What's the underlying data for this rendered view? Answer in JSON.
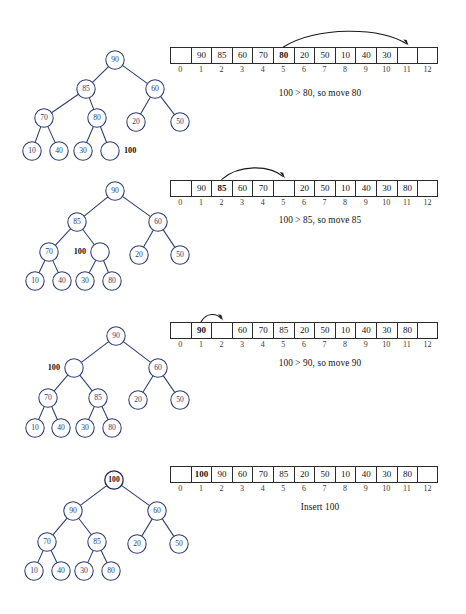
{
  "figure": {
    "node_stroke": "#2e3a72",
    "cell_stroke": "#2b2b2b",
    "arrow_color": "#1a1a1a"
  },
  "array_indices": [
    "0",
    "1",
    "2",
    "3",
    "4",
    "5",
    "6",
    "7",
    "8",
    "9",
    "10",
    "11",
    "12"
  ],
  "steps": [
    {
      "id": "step-1",
      "caption": "100 > 80, so move 80",
      "array": [
        "",
        "90",
        "85",
        "60",
        "70",
        "80",
        "20",
        "50",
        "10",
        "40",
        "30",
        "",
        ""
      ],
      "highlight_index": 5,
      "arrow": {
        "from_index": 5,
        "to_index": 11
      },
      "tree": {
        "nodes": [
          {
            "id": "n90",
            "label": "90",
            "x": 115,
            "y": 60,
            "empty": false,
            "bold": false
          },
          {
            "id": "n85",
            "label": "85",
            "x": 86,
            "y": 89,
            "empty": false,
            "bold": false
          },
          {
            "id": "n60",
            "label": "60",
            "x": 155,
            "y": 89,
            "empty": false,
            "bold": false
          },
          {
            "id": "n70",
            "label": "70",
            "x": 44,
            "y": 118,
            "empty": false,
            "bold": false
          },
          {
            "id": "n80",
            "label": "80",
            "x": 97,
            "y": 118,
            "empty": false,
            "bold": false
          },
          {
            "id": "n20",
            "label": "20",
            "x": 136,
            "y": 122,
            "empty": false,
            "bold": false
          },
          {
            "id": "n50",
            "label": "50",
            "x": 180,
            "y": 122,
            "empty": false,
            "bold": false
          },
          {
            "id": "n10",
            "label": "10",
            "x": 32,
            "y": 151,
            "empty": false,
            "bold": false
          },
          {
            "id": "n40",
            "label": "40",
            "x": 59,
            "y": 151,
            "empty": false,
            "bold": false
          },
          {
            "id": "n30",
            "label": "30",
            "x": 83,
            "y": 151,
            "empty": false,
            "bold": false
          },
          {
            "id": "nhole",
            "label": "",
            "x": 110,
            "y": 151,
            "empty": true,
            "bold": false
          }
        ],
        "edges": [
          [
            "n90",
            "n85"
          ],
          [
            "n90",
            "n60"
          ],
          [
            "n85",
            "n70"
          ],
          [
            "n85",
            "n80"
          ],
          [
            "n60",
            "n20"
          ],
          [
            "n60",
            "n50"
          ],
          [
            "n70",
            "n10"
          ],
          [
            "n70",
            "n40"
          ],
          [
            "n80",
            "n30"
          ],
          [
            "n80",
            "nhole"
          ]
        ],
        "side_label": {
          "text": "100",
          "x": 124,
          "y": 151,
          "anchor": "start"
        }
      }
    },
    {
      "id": "step-2",
      "caption": "100 > 85, so move 85",
      "array": [
        "",
        "90",
        "85",
        "60",
        "70",
        "",
        "20",
        "50",
        "10",
        "40",
        "30",
        "80",
        ""
      ],
      "highlight_index": 2,
      "arrow": {
        "from_index": 2,
        "to_index": 5
      },
      "tree": {
        "nodes": [
          {
            "id": "n90",
            "label": "90",
            "x": 115,
            "y": 43,
            "empty": false,
            "bold": false
          },
          {
            "id": "n85",
            "label": "85",
            "x": 77,
            "y": 74,
            "empty": false,
            "bold": false
          },
          {
            "id": "n60",
            "label": "60",
            "x": 158,
            "y": 74,
            "empty": false,
            "bold": false
          },
          {
            "id": "n70",
            "label": "70",
            "x": 49,
            "y": 104,
            "empty": false,
            "bold": false
          },
          {
            "id": "nhole",
            "label": "",
            "x": 100,
            "y": 104,
            "empty": true,
            "bold": false
          },
          {
            "id": "n20",
            "label": "20",
            "x": 139,
            "y": 107,
            "empty": false,
            "bold": false
          },
          {
            "id": "n50",
            "label": "50",
            "x": 180,
            "y": 107,
            "empty": false,
            "bold": false
          },
          {
            "id": "n10",
            "label": "10",
            "x": 35,
            "y": 133,
            "empty": false,
            "bold": false
          },
          {
            "id": "n40",
            "label": "40",
            "x": 62,
            "y": 133,
            "empty": false,
            "bold": false
          },
          {
            "id": "n30",
            "label": "30",
            "x": 85,
            "y": 133,
            "empty": false,
            "bold": false
          },
          {
            "id": "n80",
            "label": "80",
            "x": 112,
            "y": 133,
            "empty": false,
            "bold": false
          }
        ],
        "edges": [
          [
            "n90",
            "n85"
          ],
          [
            "n90",
            "n60"
          ],
          [
            "n85",
            "n70"
          ],
          [
            "n85",
            "nhole"
          ],
          [
            "n60",
            "n20"
          ],
          [
            "n60",
            "n50"
          ],
          [
            "n70",
            "n10"
          ],
          [
            "n70",
            "n40"
          ],
          [
            "nhole",
            "n30"
          ],
          [
            "nhole",
            "n80"
          ]
        ],
        "side_label": {
          "text": "100",
          "x": 86,
          "y": 104,
          "anchor": "end"
        }
      }
    },
    {
      "id": "step-3",
      "caption": "100 > 90, so move 90",
      "array": [
        "",
        "90",
        "",
        "60",
        "70",
        "85",
        "20",
        "50",
        "10",
        "40",
        "30",
        "80",
        ""
      ],
      "highlight_index": 1,
      "arrow": {
        "from_index": 1,
        "to_index": 2
      },
      "tree": {
        "nodes": [
          {
            "id": "n90",
            "label": "90",
            "x": 116,
            "y": 46,
            "empty": false,
            "bold": false
          },
          {
            "id": "nhole",
            "label": "",
            "x": 74,
            "y": 78,
            "empty": true,
            "bold": false
          },
          {
            "id": "n60",
            "label": "60",
            "x": 158,
            "y": 78,
            "empty": false,
            "bold": false
          },
          {
            "id": "n70",
            "label": "70",
            "x": 48,
            "y": 108,
            "empty": false,
            "bold": false
          },
          {
            "id": "n85",
            "label": "85",
            "x": 98,
            "y": 108,
            "empty": false,
            "bold": false
          },
          {
            "id": "n20",
            "label": "20",
            "x": 138,
            "y": 110,
            "empty": false,
            "bold": false
          },
          {
            "id": "n50",
            "label": "50",
            "x": 180,
            "y": 110,
            "empty": false,
            "bold": false
          },
          {
            "id": "n10",
            "label": "10",
            "x": 35,
            "y": 138,
            "empty": false,
            "bold": false
          },
          {
            "id": "n40",
            "label": "40",
            "x": 61,
            "y": 138,
            "empty": false,
            "bold": false
          },
          {
            "id": "n30",
            "label": "30",
            "x": 85,
            "y": 138,
            "empty": false,
            "bold": false
          },
          {
            "id": "n80",
            "label": "80",
            "x": 112,
            "y": 138,
            "empty": false,
            "bold": false
          }
        ],
        "edges": [
          [
            "n90",
            "nhole"
          ],
          [
            "n90",
            "n60"
          ],
          [
            "nhole",
            "n70"
          ],
          [
            "nhole",
            "n85"
          ],
          [
            "n60",
            "n20"
          ],
          [
            "n60",
            "n50"
          ],
          [
            "n70",
            "n10"
          ],
          [
            "n70",
            "n40"
          ],
          [
            "n85",
            "n30"
          ],
          [
            "n85",
            "n80"
          ]
        ],
        "side_label": {
          "text": "100",
          "x": 60,
          "y": 78,
          "anchor": "end"
        }
      }
    },
    {
      "id": "step-4",
      "caption": "Insert 100",
      "array": [
        "",
        "100",
        "90",
        "60",
        "70",
        "85",
        "20",
        "50",
        "10",
        "40",
        "30",
        "80",
        ""
      ],
      "highlight_index": 1,
      "arrow": null,
      "tree": {
        "nodes": [
          {
            "id": "n100",
            "label": "100",
            "x": 114,
            "y": 40,
            "empty": false,
            "bold": true
          },
          {
            "id": "n90",
            "label": "90",
            "x": 73,
            "y": 71,
            "empty": false,
            "bold": false
          },
          {
            "id": "n60",
            "label": "60",
            "x": 157,
            "y": 71,
            "empty": false,
            "bold": false
          },
          {
            "id": "n70",
            "label": "70",
            "x": 47,
            "y": 102,
            "empty": false,
            "bold": false
          },
          {
            "id": "n85",
            "label": "85",
            "x": 97,
            "y": 102,
            "empty": false,
            "bold": false
          },
          {
            "id": "n20",
            "label": "20",
            "x": 137,
            "y": 104,
            "empty": false,
            "bold": false
          },
          {
            "id": "n50",
            "label": "50",
            "x": 179,
            "y": 104,
            "empty": false,
            "bold": false
          },
          {
            "id": "n10",
            "label": "10",
            "x": 34,
            "y": 131,
            "empty": false,
            "bold": false
          },
          {
            "id": "n40",
            "label": "40",
            "x": 61,
            "y": 131,
            "empty": false,
            "bold": false
          },
          {
            "id": "n30",
            "label": "30",
            "x": 84,
            "y": 131,
            "empty": false,
            "bold": false
          },
          {
            "id": "n80",
            "label": "80",
            "x": 111,
            "y": 131,
            "empty": false,
            "bold": false
          }
        ],
        "edges": [
          [
            "n100",
            "n90"
          ],
          [
            "n100",
            "n60"
          ],
          [
            "n90",
            "n70"
          ],
          [
            "n90",
            "n85"
          ],
          [
            "n60",
            "n20"
          ],
          [
            "n60",
            "n50"
          ],
          [
            "n70",
            "n10"
          ],
          [
            "n70",
            "n40"
          ],
          [
            "n85",
            "n30"
          ],
          [
            "n85",
            "n80"
          ]
        ],
        "side_label": null
      }
    }
  ],
  "layout": {
    "panel_tops": [
      0,
      148,
      290,
      440
    ],
    "array_left": 170,
    "array_top_offsets": [
      47,
      180,
      322,
      466
    ],
    "caption_top_offsets": [
      88,
      215,
      358,
      502
    ],
    "cell_width": 20.6,
    "node_radius": 9.2
  }
}
